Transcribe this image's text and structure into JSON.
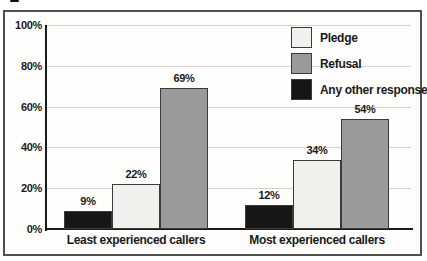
{
  "figure": {
    "background": "#ffffff",
    "frame_color": "#4f4f4f"
  },
  "chart_data": {
    "type": "bar",
    "title": "",
    "categories": [
      "Least experienced callers",
      "Most experienced callers"
    ],
    "series": [
      {
        "name": "Pledge",
        "values": [
          22,
          34
        ],
        "labels": [
          "22%",
          "34%"
        ],
        "color": "#f1f0ed"
      },
      {
        "name": "Refusal",
        "values": [
          69,
          54
        ],
        "labels": [
          "69%",
          "54%"
        ],
        "color": "#9a9a9a"
      },
      {
        "name": "Any other response",
        "values": [
          9,
          12
        ],
        "labels": [
          "9%",
          "12%"
        ],
        "color": "#161616"
      }
    ],
    "plot_order": [
      2,
      0,
      1
    ],
    "y_ticks": [
      {
        "value": 0,
        "label": "0%"
      },
      {
        "value": 20,
        "label": "20%"
      },
      {
        "value": 40,
        "label": "40%"
      },
      {
        "value": 60,
        "label": "60%"
      },
      {
        "value": 80,
        "label": "80%"
      },
      {
        "value": 100,
        "label": "100%"
      }
    ],
    "ylim": [
      0,
      100
    ],
    "grid": true,
    "legend": {
      "position": "top-right",
      "entries": [
        "Pledge",
        "Refusal",
        "Any other response"
      ]
    },
    "axis_color": "#1a1a1a",
    "gridline_color": "#d3d3d3",
    "bar_border_color": "#3a3a3a",
    "text_color": "#1a1a1a"
  }
}
